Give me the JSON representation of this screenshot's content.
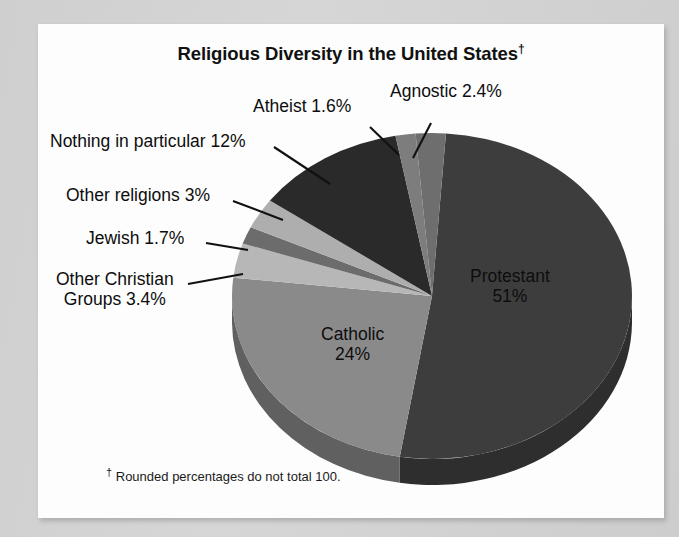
{
  "page": {
    "background_color": "#d2d2d2",
    "card_color": "#fdfdfd"
  },
  "chart_data": {
    "type": "pie",
    "title": "Religious Diversity in the United States",
    "title_dagger": "†",
    "footnote_dagger": "†",
    "footnote": "Rounded percentages do not total 100.",
    "three_d": true,
    "start_angle_deg": -86,
    "categories": [
      "Protestant",
      "Catholic",
      "Other Christian Groups",
      "Jewish",
      "Other religions",
      "Nothing in particular",
      "Atheist",
      "Agnostic"
    ],
    "values": [
      51,
      24,
      3.4,
      1.7,
      3,
      12,
      1.6,
      2.4
    ],
    "total_note": "Rounded percentages do not total 100.",
    "slices": [
      {
        "name": "Protestant",
        "label": "Protestant",
        "value_label": "51%",
        "value": 51,
        "color": "#3d3d3d",
        "side_color": "#2e2e2e",
        "label_placement": "inside"
      },
      {
        "name": "Catholic",
        "label": "Catholic",
        "value_label": "24%",
        "value": 24,
        "color": "#8a8a8a",
        "side_color": "#606060",
        "label_placement": "inside"
      },
      {
        "name": "Other Christian Groups",
        "label": "Other Christian",
        "label_line2": "Groups 3.4%",
        "value_label": "3.4%",
        "value": 3.4,
        "color": "#b7b7b7",
        "side_color": "#8c8c8c",
        "label_placement": "callout"
      },
      {
        "name": "Jewish",
        "label": "Jewish 1.7%",
        "value_label": "1.7%",
        "value": 1.7,
        "color": "#6c6c6c",
        "side_color": "#4e4e4e",
        "label_placement": "callout"
      },
      {
        "name": "Other religions",
        "label": "Other religions 3%",
        "value_label": "3%",
        "value": 3,
        "color": "#aeaeae",
        "side_color": "#848484",
        "label_placement": "callout"
      },
      {
        "name": "Nothing in particular",
        "label": "Nothing in particular 12%",
        "value_label": "12%",
        "value": 12,
        "color": "#2a2a2a",
        "side_color": "#1e1e1e",
        "label_placement": "callout"
      },
      {
        "name": "Atheist",
        "label": "Atheist 1.6%",
        "value_label": "1.6%",
        "value": 1.6,
        "color": "#7d7d7d",
        "side_color": "#5a5a5a",
        "label_placement": "callout"
      },
      {
        "name": "Agnostic",
        "label": "Agnostic 2.4%",
        "value_label": "2.4%",
        "value": 2.4,
        "color": "#6e6e6e",
        "side_color": "#505050",
        "label_placement": "callout"
      }
    ],
    "legend": "none",
    "grid": false,
    "xlabel": "",
    "ylabel": ""
  }
}
